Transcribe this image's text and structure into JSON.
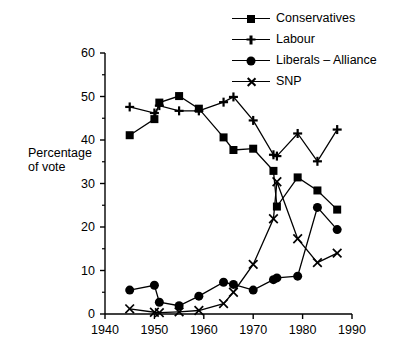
{
  "chart_data": {
    "type": "line",
    "title": "",
    "xlabel": "",
    "ylabel": "Percentage of vote",
    "xlim": [
      1940,
      1990
    ],
    "ylim": [
      0,
      60
    ],
    "yticks": [
      0,
      10,
      20,
      30,
      40,
      50,
      60
    ],
    "ytick_labels": [
      "0",
      "10",
      "20",
      "30",
      "40",
      "50",
      "60"
    ],
    "y_minor_ticks": [
      5,
      15,
      25,
      35,
      45,
      55
    ],
    "xticks": [
      1940,
      1950,
      1960,
      1970,
      1980,
      1990
    ],
    "xtick_labels": [
      "1940",
      "1950",
      "1960",
      "1970",
      "1980",
      "1990"
    ],
    "grid": false,
    "legend_position": "top-right",
    "series": [
      {
        "name": "Conservatives",
        "marker": "square",
        "x": [
          1945,
          1950,
          1951,
          1955,
          1959,
          1964,
          1966,
          1970,
          1974.1,
          1974.8,
          1979,
          1983,
          1987
        ],
        "values": [
          41.1,
          44.8,
          48.6,
          50.1,
          47.2,
          40.6,
          37.7,
          38.0,
          32.9,
          24.7,
          31.4,
          28.4,
          24.0
        ]
      },
      {
        "name": "Labour",
        "marker": "plus",
        "x": [
          1945,
          1950,
          1951,
          1955,
          1959,
          1964,
          1966,
          1970,
          1974.1,
          1974.8,
          1979,
          1983,
          1987
        ],
        "values": [
          47.6,
          46.2,
          47.9,
          46.7,
          46.7,
          48.7,
          49.9,
          44.5,
          36.6,
          36.3,
          41.5,
          35.1,
          42.4
        ]
      },
      {
        "name": "Liberals – Alliance",
        "marker": "circle",
        "x": [
          1945,
          1950,
          1951,
          1955,
          1959,
          1964,
          1966,
          1970,
          1974.1,
          1974.8,
          1979,
          1983,
          1987
        ],
        "values": [
          5.5,
          6.6,
          2.7,
          1.9,
          4.1,
          7.3,
          6.8,
          5.5,
          7.9,
          8.3,
          8.7,
          24.5,
          19.4
        ]
      },
      {
        "name": "SNP",
        "marker": "x",
        "x": [
          1945,
          1950,
          1951,
          1955,
          1959,
          1964,
          1966,
          1970,
          1974.1,
          1974.8,
          1979,
          1983,
          1987
        ],
        "values": [
          1.2,
          0.4,
          0.3,
          0.5,
          0.8,
          2.4,
          5.0,
          11.4,
          21.9,
          30.4,
          17.3,
          11.8,
          14.0
        ]
      }
    ]
  },
  "legend": {
    "items": [
      {
        "label": "Conservatives",
        "marker": "square"
      },
      {
        "label": "Labour",
        "marker": "plus"
      },
      {
        "label": "Liberals – Alliance",
        "marker": "circle"
      },
      {
        "label": "SNP",
        "marker": "x"
      }
    ]
  },
  "axis": {
    "y_label_line1": "Percentage",
    "y_label_line2": "of vote"
  },
  "colors": {
    "ink": "#000000",
    "background": "#ffffff"
  }
}
